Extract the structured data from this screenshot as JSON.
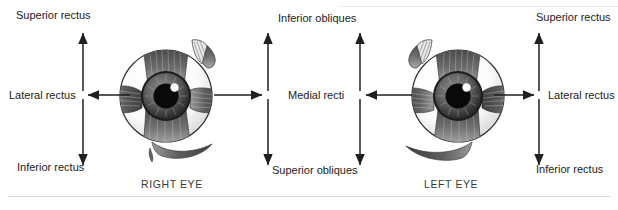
{
  "figure": {
    "background_color": "#ffffff",
    "line_color": "#222222",
    "rule_color": "#d8d8d8"
  },
  "eyes": [
    {
      "id": "right-eye",
      "caption": "RIGHT EYE",
      "cx": 167,
      "cy": 97
    },
    {
      "id": "left-eye",
      "caption": "LEFT EYE",
      "cx": 455,
      "cy": 97
    }
  ],
  "labels": {
    "left_group": {
      "superior_rectus": "Superior rectus",
      "lateral_rectus": "Lateral rectus",
      "inferior_rectus": "Inferior rectus"
    },
    "center_group": {
      "inferior_obliques": "Inferior obliques",
      "medial_recti": "Medial recti",
      "superior_obliques": "Superior obliques"
    },
    "right_group": {
      "superior_rectus": "Superior rectus",
      "lateral_rectus": "Lateral rectus",
      "inferior_rectus": "Inferior rectus"
    }
  }
}
